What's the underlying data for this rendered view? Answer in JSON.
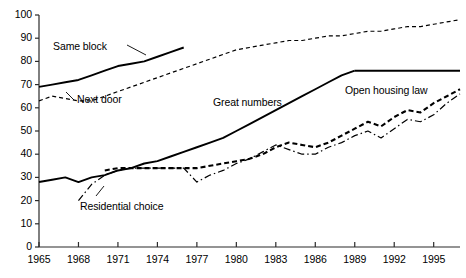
{
  "chart_data": {
    "type": "line",
    "title": "",
    "subtitle": "",
    "xlabel": "",
    "ylabel": "",
    "xlim": [
      1965,
      1997
    ],
    "ylim": [
      0,
      100
    ],
    "grid": false,
    "legend_position": "inline-annotations",
    "xticks": [
      "1965",
      "1968",
      "1971",
      "1974",
      "1977",
      "1980",
      "1983",
      "1986",
      "1989",
      "1992",
      "1995"
    ],
    "xtick_values": [
      1965,
      1968,
      1971,
      1974,
      1977,
      1980,
      1983,
      1986,
      1989,
      1992,
      1995
    ],
    "yticks": [
      "0",
      "10",
      "20",
      "30",
      "40",
      "50",
      "60",
      "70",
      "80",
      "90",
      "100"
    ],
    "ytick_values": [
      0,
      10,
      20,
      30,
      40,
      50,
      60,
      70,
      80,
      90,
      100
    ],
    "series": [
      {
        "name": "Same block",
        "style": "solid",
        "color": "#000000",
        "x": [
          1965,
          1966,
          1967,
          1968,
          1969,
          1970,
          1971,
          1972,
          1973,
          1974,
          1975,
          1976
        ],
        "values": [
          69,
          70,
          71,
          72,
          74,
          76,
          78,
          79,
          80,
          82,
          84,
          86
        ]
      },
      {
        "name": "Next door",
        "style": "dashed",
        "color": "#000000",
        "x": [
          1965,
          1966,
          1967,
          1968,
          1969,
          1970,
          1971,
          1972,
          1973,
          1974,
          1975,
          1976,
          1977,
          1978,
          1979,
          1980,
          1981,
          1982,
          1983,
          1984,
          1985,
          1986,
          1987,
          1988,
          1989,
          1990,
          1991,
          1992,
          1993,
          1994,
          1995,
          1996,
          1997
        ],
        "values": [
          63,
          65,
          64,
          63,
          63,
          65,
          67,
          69,
          71,
          73,
          75,
          77,
          79,
          81,
          83,
          85,
          86,
          87,
          88,
          89,
          89,
          90,
          91,
          91,
          92,
          93,
          93,
          94,
          95,
          95,
          96,
          97,
          98
        ]
      },
      {
        "name": "Great numbers",
        "style": "solid",
        "color": "#000000",
        "x": [
          1965,
          1966,
          1967,
          1968,
          1969,
          1970,
          1971,
          1972,
          1973,
          1974,
          1975,
          1976,
          1977,
          1978,
          1979,
          1980,
          1981,
          1982,
          1983,
          1984,
          1985,
          1986,
          1987,
          1988,
          1989
        ],
        "values": [
          28,
          29,
          30,
          28,
          30,
          31,
          33,
          34,
          36,
          37,
          39,
          41,
          43,
          45,
          47,
          50,
          53,
          56,
          59,
          62,
          65,
          68,
          71,
          74,
          76
        ]
      },
      {
        "name": "Open housing law",
        "style": "solid",
        "color": "#000000",
        "x": [
          1989,
          1990,
          1991,
          1992,
          1993,
          1994,
          1995,
          1996,
          1997
        ],
        "values": [
          76,
          76,
          76,
          76,
          76,
          76,
          76,
          76,
          76
        ]
      },
      {
        "name": "Residential choice (dashed series)",
        "style": "dashed-bold",
        "color": "#000000",
        "x": [
          1970,
          1971,
          1972,
          1973,
          1974,
          1975,
          1976,
          1977,
          1978,
          1979,
          1980,
          1981,
          1982,
          1983,
          1984,
          1985,
          1986,
          1987,
          1988,
          1989,
          1990,
          1991,
          1992,
          1993,
          1994,
          1995,
          1996,
          1997
        ],
        "values": [
          33,
          34,
          34,
          34,
          34,
          34,
          34,
          34,
          35,
          36,
          37,
          38,
          40,
          43,
          45,
          44,
          43,
          45,
          48,
          51,
          54,
          52,
          56,
          59,
          58,
          62,
          65,
          68
        ]
      },
      {
        "name": "Residential choice",
        "style": "dash-dot",
        "color": "#000000",
        "x": [
          1968,
          1969,
          1970,
          1971,
          1972,
          1973,
          1974,
          1975,
          1976,
          1977,
          1978,
          1979,
          1980,
          1981,
          1982,
          1983,
          1984,
          1985,
          1986,
          1987,
          1988,
          1989,
          1990,
          1991,
          1992,
          1993,
          1994,
          1995,
          1996,
          1997
        ],
        "values": [
          20,
          27,
          31,
          33,
          34,
          34,
          34,
          34,
          34,
          28,
          31,
          33,
          36,
          38,
          41,
          44,
          42,
          40,
          40,
          43,
          45,
          48,
          50,
          47,
          51,
          55,
          54,
          57,
          62,
          66
        ]
      }
    ],
    "annotations": [
      {
        "text": "Same block",
        "x_px": 53,
        "y_px": 40
      },
      {
        "text": "Next door",
        "x_px": 77,
        "y_px": 93
      },
      {
        "text": "Great numbers",
        "x_px": 213,
        "y_px": 96
      },
      {
        "text": "Open housing law",
        "x_px": 345,
        "y_px": 84
      },
      {
        "text": "Residential choice",
        "x_px": 80,
        "y_px": 200
      }
    ]
  }
}
